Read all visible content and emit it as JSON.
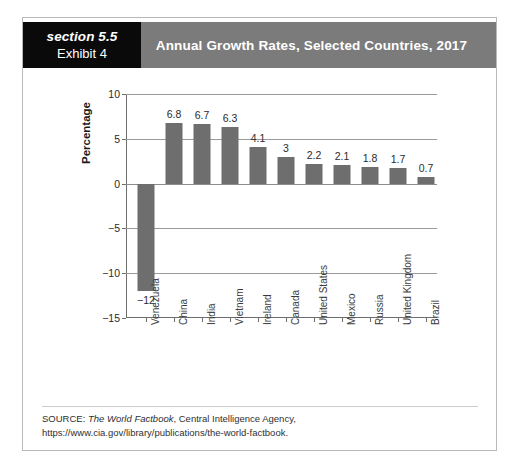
{
  "header": {
    "section_label": "section 5.5",
    "exhibit_label": "Exhibit 4",
    "title": "Annual Growth Rates, Selected Countries, 2017",
    "black_block_color": "#0a0a0a",
    "banner_color": "#7b7b7b"
  },
  "source": {
    "prefix": "SOURCE: ",
    "italic_title": "The World Factbook",
    "rest": ", Central Intelligence Agency, https://www.cia.gov/library/publications/the-world-factbook."
  },
  "chart_data": {
    "type": "bar",
    "title": "Annual Growth Rates, Selected Countries, 2017",
    "xlabel": "",
    "ylabel": "Percentage",
    "ylim": [
      -15,
      10
    ],
    "yticks": [
      10,
      5,
      0,
      -5,
      -10,
      -15
    ],
    "ytick_labels": [
      "10",
      "5",
      "0",
      "−5",
      "−10",
      "−15"
    ],
    "grid": true,
    "legend": "none",
    "bar_color": "#6e6e6e",
    "categories": [
      "Venezuela",
      "China",
      "India",
      "Vietnam",
      "Ireland",
      "Canada",
      "United States",
      "Mexico",
      "Russia",
      "United Kingdom",
      "Brazil"
    ],
    "values": [
      -12,
      6.8,
      6.7,
      6.3,
      4.1,
      3,
      2.2,
      2.1,
      1.8,
      1.7,
      0.7
    ],
    "value_labels": [
      "−12",
      "6.8",
      "6.7",
      "6.3",
      "4.1",
      "3",
      "2.2",
      "2.1",
      "1.8",
      "1.7",
      "0.7"
    ]
  }
}
